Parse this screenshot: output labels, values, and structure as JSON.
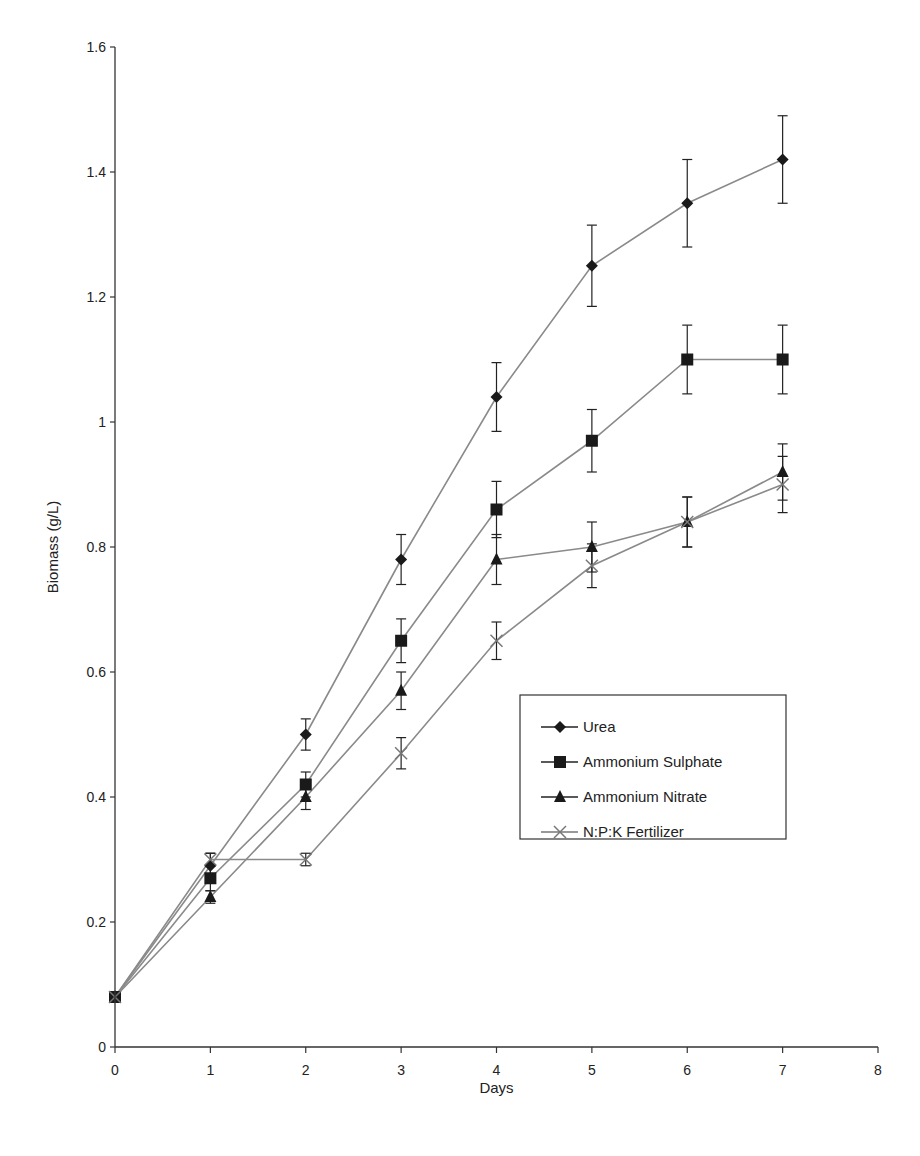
{
  "chart_data": {
    "type": "line",
    "title": "",
    "xlabel": "Days",
    "ylabel": "Biomass (g/L)",
    "xlim": [
      0,
      8
    ],
    "ylim": [
      0,
      1.6
    ],
    "x_ticks": [
      "0",
      "1",
      "2",
      "3",
      "4",
      "5",
      "6",
      "7",
      "8"
    ],
    "y_ticks": [
      "0",
      "0.2",
      "0.4",
      "0.6",
      "0.8",
      "1",
      "1.2",
      "1.4",
      "1.6"
    ],
    "grid": false,
    "legend_position": "inside-right",
    "x": [
      0,
      1,
      2,
      3,
      4,
      5,
      6,
      7
    ],
    "series": [
      {
        "name": "Urea",
        "marker": "diamond",
        "values": [
          0.08,
          0.29,
          0.5,
          0.78,
          1.04,
          1.25,
          1.35,
          1.42
        ],
        "errors": [
          0,
          0.02,
          0.025,
          0.04,
          0.055,
          0.065,
          0.07,
          0.07
        ]
      },
      {
        "name": "Ammonium Sulphate",
        "marker": "square",
        "values": [
          0.08,
          0.27,
          0.42,
          0.65,
          0.86,
          0.97,
          1.1,
          1.1
        ],
        "errors": [
          0,
          0.02,
          0.02,
          0.035,
          0.045,
          0.05,
          0.055,
          0.055
        ]
      },
      {
        "name": "Ammonium Nitrate",
        "marker": "triangle",
        "values": [
          0.08,
          0.24,
          0.4,
          0.57,
          0.78,
          0.8,
          0.84,
          0.92
        ],
        "errors": [
          0,
          0.01,
          0.02,
          0.03,
          0.04,
          0.04,
          0.04,
          0.045
        ]
      },
      {
        "name": "N:P:K Fertilizer",
        "marker": "x",
        "values": [
          0.08,
          0.3,
          0.3,
          0.47,
          0.65,
          0.77,
          0.84,
          0.9
        ],
        "errors": [
          0,
          0.01,
          0.01,
          0.025,
          0.03,
          0.035,
          0.04,
          0.045
        ]
      }
    ]
  },
  "colors": {
    "line": "#8a8a8a",
    "marker": "#1a1a1a",
    "axis": "#333333",
    "text": "#222222"
  }
}
